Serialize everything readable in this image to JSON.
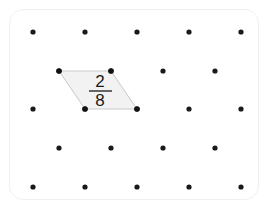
{
  "board": {
    "title": "Geoboard",
    "background_color": "#ffffff",
    "card_border_color": "#f0f0f0",
    "card_radius": 14,
    "peg_color": "#1a1a1a",
    "peg_radius": 2.6,
    "grid": {
      "type": "staggered",
      "rows": 5,
      "row_y": [
        32,
        71,
        109,
        148,
        187
      ],
      "odd_row_x": [
        33,
        85,
        137,
        189,
        241
      ],
      "even_row_x": [
        59,
        111,
        163,
        215
      ],
      "points": [
        {
          "row": 1,
          "x": 33,
          "y": 32
        },
        {
          "row": 1,
          "x": 85,
          "y": 32
        },
        {
          "row": 1,
          "x": 137,
          "y": 32
        },
        {
          "row": 1,
          "x": 189,
          "y": 32
        },
        {
          "row": 1,
          "x": 241,
          "y": 32
        },
        {
          "row": 2,
          "x": 59,
          "y": 71
        },
        {
          "row": 2,
          "x": 111,
          "y": 71
        },
        {
          "row": 2,
          "x": 163,
          "y": 71
        },
        {
          "row": 2,
          "x": 215,
          "y": 71
        },
        {
          "row": 3,
          "x": 33,
          "y": 109
        },
        {
          "row": 3,
          "x": 85,
          "y": 109
        },
        {
          "row": 3,
          "x": 137,
          "y": 109
        },
        {
          "row": 3,
          "x": 189,
          "y": 109
        },
        {
          "row": 3,
          "x": 241,
          "y": 109
        },
        {
          "row": 4,
          "x": 59,
          "y": 148
        },
        {
          "row": 4,
          "x": 111,
          "y": 148
        },
        {
          "row": 4,
          "x": 163,
          "y": 148
        },
        {
          "row": 4,
          "x": 215,
          "y": 148
        },
        {
          "row": 5,
          "x": 33,
          "y": 187
        },
        {
          "row": 5,
          "x": 85,
          "y": 187
        },
        {
          "row": 5,
          "x": 137,
          "y": 187
        },
        {
          "row": 5,
          "x": 189,
          "y": 187
        },
        {
          "row": 5,
          "x": 241,
          "y": 187
        }
      ]
    }
  },
  "shape": {
    "name": "parallelogram",
    "fill_color": "#f2f2f2",
    "stroke_color": "#c9c9c9",
    "points": "59,71 111,71 137,109 85,109",
    "vertices": [
      {
        "label": "top-left",
        "x": 59,
        "y": 71
      },
      {
        "label": "top-right",
        "x": 111,
        "y": 71
      },
      {
        "label": "bottom-right",
        "x": 137,
        "y": 109
      },
      {
        "label": "bottom-left",
        "x": 85,
        "y": 109
      }
    ],
    "vertex_radius": 2.8
  },
  "label": {
    "type": "fraction",
    "numerator": "2",
    "denominator": "8",
    "text": "2/8",
    "center_x": 100,
    "numerator_y": 87,
    "rule_y": 91,
    "denominator_y": 106,
    "rule_x1": 89,
    "rule_x2": 112,
    "color": "#1a1a1a"
  }
}
